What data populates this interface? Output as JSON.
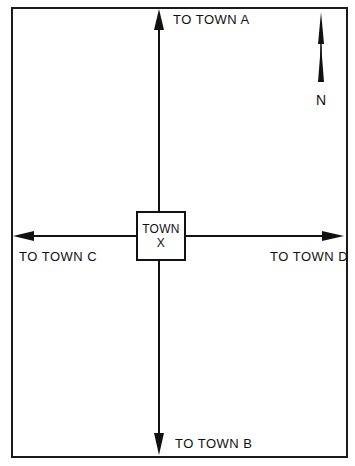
{
  "diagram": {
    "type": "road-direction-map",
    "center": {
      "line1": "TOWN",
      "line2": "X"
    },
    "roads": [
      {
        "direction": "north",
        "label": "TO TOWN A"
      },
      {
        "direction": "south",
        "label": "TO TOWN B"
      },
      {
        "direction": "west",
        "label": "TO TOWN C"
      },
      {
        "direction": "east",
        "label": "TO TOWN D"
      }
    ],
    "compass": {
      "label": "N",
      "icon": "north-arrow-icon"
    },
    "colors": {
      "line": "#111111",
      "background": "#ffffff"
    }
  }
}
